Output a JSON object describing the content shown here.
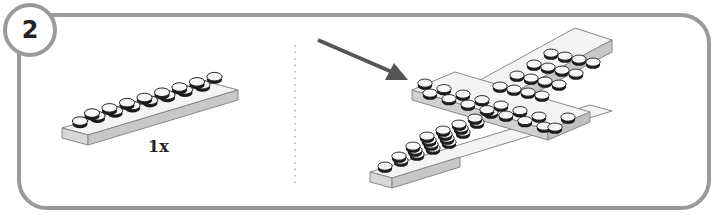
{
  "step": {
    "number": "2"
  },
  "parts_callout": {
    "quantity": "1x",
    "part": "2x8 plate"
  },
  "colors": {
    "border": "#9a9a9a",
    "arrow": "#555555",
    "plate_top": "#f4f4f4",
    "plate_side": "#cfcfcf",
    "stud_dark": "#1a1a1a"
  }
}
